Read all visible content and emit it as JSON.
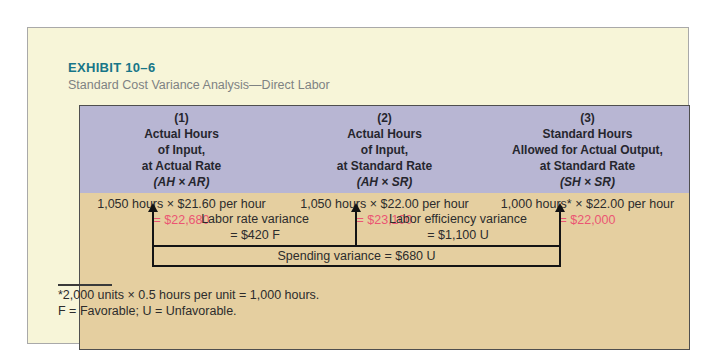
{
  "exhibit": {
    "label": "EXHIBIT 10–6",
    "subtitle": "Standard Cost Variance Analysis—Direct Labor"
  },
  "columns": [
    {
      "number": "(1)",
      "lines": [
        "Actual Hours",
        "of Input,",
        "at Actual Rate"
      ],
      "formula": "(AH × AR)",
      "computation": "1,050 hours × $21.60 per hour",
      "result": "= $22,680"
    },
    {
      "number": "(2)",
      "lines": [
        "Actual Hours",
        "of Input,",
        "at Standard Rate"
      ],
      "formula": "(AH × SR)",
      "computation": "1,050 hours × $22.00 per hour",
      "result": "= $23,100"
    },
    {
      "number": "(3)",
      "lines": [
        "Standard Hours",
        "Allowed for Actual Output,",
        "at Standard Rate"
      ],
      "formula": "(SH × SR)",
      "computation": "1,000 hours* × $22.00 per hour",
      "result": "= $22,000"
    }
  ],
  "variances": {
    "rate": {
      "label": "Labor rate variance",
      "value": "= $420 F"
    },
    "efficiency": {
      "label": "Labor efficiency variance",
      "value": "= $1,100 U"
    },
    "spending": {
      "label": "Spending variance = $680 U"
    }
  },
  "footnotes": [
    "*2,000 units × 0.5 hours per unit = 1,000 hours.",
    "F = Favorable; U = Unfavorable."
  ],
  "colors": {
    "accent_teal": "#177688",
    "result_pink": "#eb5573",
    "header_purple": "#b8b6d3",
    "body_tan": "#e5cfa0",
    "panel_cream": "#f7f5d8"
  }
}
